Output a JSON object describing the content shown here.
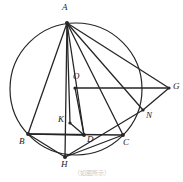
{
  "figure": {
    "caption": "（如图所示）",
    "stroke_color": "#262626",
    "label_color": "#1a1a1a",
    "background": "#ffffff",
    "circle": {
      "cx": 76,
      "cy": 89,
      "r": 66,
      "stroke_width": 1.2
    },
    "points": [
      {
        "id": "A",
        "label": "A",
        "x": 67,
        "y": 23,
        "label_x": 62,
        "label_y": 3,
        "dot": true,
        "dot_r": 2.0
      },
      {
        "id": "O",
        "label": "O",
        "x": 75,
        "y": 88,
        "label_x": 73,
        "label_y": 72,
        "dot": true,
        "dot_r": 1.6
      },
      {
        "id": "G",
        "label": "G",
        "x": 169,
        "y": 88,
        "label_x": 173,
        "label_y": 82,
        "dot": true,
        "dot_r": 1.6
      },
      {
        "id": "N",
        "label": "N",
        "x": 143,
        "y": 110,
        "label_x": 146,
        "label_y": 111,
        "dot": true,
        "dot_r": 1.6
      },
      {
        "id": "K",
        "label": "K",
        "x": 70,
        "y": 123,
        "label_x": 58,
        "label_y": 115,
        "dot": true,
        "dot_r": 1.6
      },
      {
        "id": "D",
        "label": "D",
        "x": 84,
        "y": 135,
        "label_x": 87,
        "label_y": 135,
        "dot": true,
        "dot_r": 1.9
      },
      {
        "id": "B",
        "label": "B",
        "x": 28,
        "y": 134,
        "label_x": 19,
        "label_y": 137,
        "dot": true,
        "dot_r": 1.9
      },
      {
        "id": "C",
        "label": "C",
        "x": 123,
        "y": 135,
        "label_x": 123,
        "label_y": 138,
        "dot": true,
        "dot_r": 1.9
      },
      {
        "id": "H",
        "label": "H",
        "x": 65,
        "y": 157,
        "label_x": 61,
        "label_y": 160,
        "dot": true,
        "dot_r": 2.0
      }
    ],
    "segments": [
      {
        "id": "AB",
        "from": "A",
        "to": "B",
        "width": 1.3
      },
      {
        "id": "AH",
        "from": "A",
        "to": "H",
        "width": 1.3
      },
      {
        "id": "AD",
        "from": "A",
        "to": "D",
        "width": 1.3
      },
      {
        "id": "AC",
        "from": "A",
        "to": "C",
        "width": 1.3
      },
      {
        "id": "AN",
        "from": "A",
        "to": "N",
        "width": 1.3
      },
      {
        "id": "AG",
        "from": "A",
        "to": "G",
        "width": 1.3
      },
      {
        "id": "OG",
        "from": "O",
        "to": "G",
        "width": 1.3
      },
      {
        "id": "NG",
        "from": "N",
        "to": "G",
        "width": 1.3
      },
      {
        "id": "HN",
        "from": "H",
        "to": "N",
        "width": 1.3
      },
      {
        "id": "BC",
        "from": "B",
        "to": "C",
        "width": 1.3
      },
      {
        "id": "BD",
        "from": "B",
        "to": "D",
        "width": 1.3
      },
      {
        "id": "KD",
        "from": "K",
        "to": "D",
        "width": 1.3
      },
      {
        "id": "KA",
        "from": "K",
        "to": "A",
        "width": 1.3
      },
      {
        "id": "OD",
        "from": "O",
        "to": "D",
        "width": 1.3
      },
      {
        "id": "HC",
        "from": "H",
        "to": "C",
        "width": 1.3
      },
      {
        "id": "HB",
        "from": "H",
        "to": "B",
        "width": 1.3
      }
    ]
  }
}
